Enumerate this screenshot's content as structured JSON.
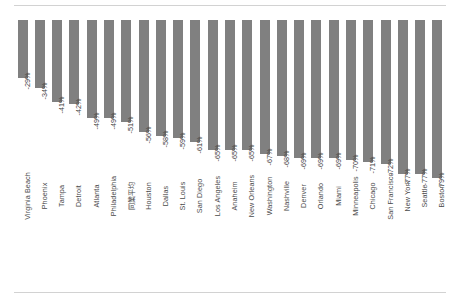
{
  "chart_data": {
    "type": "bar",
    "title": "",
    "subtitle": "",
    "xlabel": "",
    "ylabel": "",
    "ylim": [
      -85,
      0
    ],
    "grid": false,
    "legend": null,
    "orientation": "vertical-negative",
    "bar_color": "#808080",
    "categories": [
      "Virginia Beach",
      "Phoenix",
      "Tampa",
      "Detroit",
      "Atlanta",
      "Philadelphia",
      "同業平均",
      "Houston",
      "Dallas",
      "St. Louis",
      "San Diego",
      "Los Angeles",
      "Anaheim",
      "New Orleans",
      "Washington",
      "Nashville",
      "Denver",
      "Orlando",
      "Miami",
      "Minneapolis",
      "Chicago",
      "San Francisco",
      "New York",
      "Seattle",
      "Boston"
    ],
    "values": [
      -29,
      -34,
      -41,
      -42,
      -49,
      -49,
      -51,
      -56,
      -58,
      -59,
      -61,
      -65,
      -65,
      -65,
      -67,
      -68,
      -69,
      -69,
      -69,
      -70,
      -71,
      -72,
      -77,
      -77,
      -79
    ],
    "value_labels": [
      "-29%",
      "-34%",
      "-41%",
      "-42%",
      "-49%",
      "-49%",
      "-51%",
      "-56%",
      "-58%",
      "-59%",
      "-61%",
      "-65%",
      "-65%",
      "-65%",
      "-67%",
      "-68%",
      "-69%",
      "-69%",
      "-69%",
      "-70%",
      "-71%",
      "-72%",
      "-77%",
      "-77%",
      "-79%"
    ],
    "extra_value_label": "-80%"
  },
  "colors": {
    "bar": "#808080",
    "rule": "#d2d2d2",
    "text": "#4a4a4a"
  }
}
